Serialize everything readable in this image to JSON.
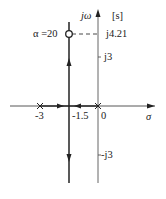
{
  "diagram": {
    "type": "root-locus",
    "plane_label": "[s]",
    "axes": {
      "imaginary_label": "jω",
      "real_label": "σ"
    },
    "poles": [
      {
        "label": "-3",
        "value": -3
      },
      {
        "label": "0",
        "value": 0
      }
    ],
    "breakaway": {
      "label": "-1.5",
      "value": -1.5
    },
    "imag_ticks": [
      {
        "label": "j4.21",
        "value": 4.21
      },
      {
        "label": "j3",
        "value": 3
      },
      {
        "label": "-j3",
        "value": -3
      }
    ],
    "marker": {
      "label": "α =20",
      "imag": 4.21,
      "real": -1.5
    },
    "colors": {
      "line": "#222222",
      "axis": "#555555"
    }
  }
}
